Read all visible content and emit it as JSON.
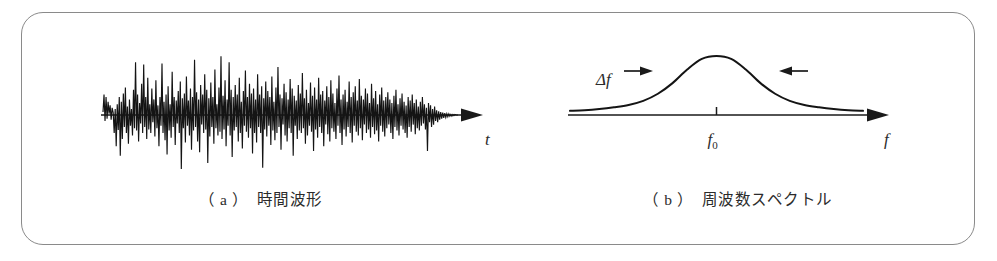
{
  "figure": {
    "background_color": "#ffffff",
    "border_color": "#8a8a8a",
    "ink_color": "#1a1a1a",
    "panels": [
      {
        "id": "a",
        "caption": "（ a ）　時間波形",
        "axis_label": "t",
        "type": "time-waveform"
      },
      {
        "id": "b",
        "caption": "（ b ）　周波数スペクトル",
        "axis_label": "f",
        "center_tick_label": "f",
        "center_tick_sub": "0",
        "bandwidth_label": "Δf",
        "type": "frequency-spectrum"
      }
    ]
  },
  "chart_data": [
    {
      "type": "line",
      "id": "time-waveform",
      "title": "（ a ）　時間波形",
      "xlabel": "t",
      "ylabel": "",
      "grid": false,
      "legend": null,
      "xlim": [
        0,
        360
      ],
      "ylim": [
        -1.15,
        1.15
      ],
      "baseline": 0,
      "description": "Random narrow-band noise amplitude versus time; zero baseline drawn as horizontal axis with arrowhead at right.",
      "values": [
        0.05,
        0.34,
        -0.1,
        0.3,
        -0.06,
        0.22,
        0.02,
        0.16,
        -0.08,
        0.12,
        0.04,
        -0.3,
        0.1,
        -0.52,
        0.18,
        -0.25,
        0.3,
        -0.68,
        0.22,
        -0.4,
        0.36,
        -0.2,
        0.46,
        -0.3,
        0.14,
        -0.48,
        0.26,
        -0.18,
        0.1,
        -0.34,
        0.42,
        -0.22,
        0.88,
        -0.26,
        0.34,
        -0.44,
        0.2,
        -0.14,
        0.52,
        -0.3,
        0.84,
        -0.2,
        0.3,
        -0.4,
        0.62,
        -0.24,
        0.18,
        -0.3,
        0.44,
        -0.12,
        0.26,
        -0.36,
        0.58,
        -0.22,
        0.16,
        -0.52,
        0.3,
        -0.18,
        0.86,
        -0.3,
        0.22,
        -0.42,
        0.34,
        -0.66,
        0.48,
        -0.26,
        0.18,
        -0.38,
        0.72,
        -0.2,
        0.3,
        -0.5,
        0.24,
        -0.14,
        0.4,
        -0.3,
        0.56,
        -0.9,
        0.28,
        -0.22,
        0.36,
        -0.46,
        0.64,
        -0.18,
        0.24,
        -0.34,
        0.44,
        -0.58,
        0.3,
        -0.26,
        0.92,
        -0.2,
        0.38,
        -0.44,
        0.26,
        -0.62,
        0.5,
        -0.16,
        0.34,
        -0.3,
        0.68,
        -0.24,
        0.42,
        -0.8,
        0.28,
        -0.36,
        0.54,
        -0.2,
        0.3,
        -0.48,
        0.76,
        -0.22,
        0.18,
        -0.34,
        0.46,
        -0.28,
        0.98,
        -0.4,
        0.32,
        -0.24,
        0.58,
        -0.52,
        0.26,
        -0.18,
        0.88,
        -0.34,
        0.42,
        -0.7,
        0.3,
        -0.26,
        0.5,
        -0.2,
        0.34,
        -0.44,
        0.62,
        -0.3,
        0.22,
        -0.56,
        0.4,
        -0.18,
        0.74,
        -0.28,
        0.3,
        -0.38,
        0.52,
        -0.22,
        0.36,
        -0.64,
        0.44,
        -0.3,
        0.26,
        -0.46,
        0.68,
        -0.2,
        0.34,
        -0.3,
        0.48,
        -0.88,
        0.28,
        -0.24,
        0.56,
        -0.36,
        0.4,
        -0.18,
        0.3,
        -0.5,
        0.64,
        -0.26,
        0.22,
        -0.42,
        0.46,
        -0.3,
        0.8,
        -0.2,
        0.34,
        -0.58,
        0.28,
        -0.16,
        0.52,
        -0.34,
        0.38,
        -0.44,
        0.26,
        -0.22,
        0.6,
        -0.3,
        0.44,
        -0.68,
        0.32,
        -0.18,
        0.24,
        -0.4,
        0.5,
        -0.26,
        0.36,
        -0.3,
        0.7,
        -0.22,
        0.28,
        -0.48,
        0.42,
        -0.34,
        0.2,
        -0.18,
        0.54,
        -0.28,
        0.32,
        -0.6,
        0.46,
        -0.24,
        0.26,
        -0.38,
        0.62,
        -0.2,
        0.34,
        -0.3,
        0.4,
        -0.52,
        0.24,
        -0.16,
        0.48,
        -0.32,
        0.3,
        -0.44,
        0.58,
        -0.22,
        0.36,
        -0.28,
        0.2,
        -0.4,
        0.44,
        -0.18,
        0.66,
        -0.3,
        0.26,
        -0.5,
        0.34,
        -0.24,
        0.42,
        -0.36,
        0.22,
        -0.2,
        0.56,
        -0.3,
        0.3,
        -0.46,
        0.38,
        -0.18,
        0.48,
        -0.28,
        0.24,
        -0.34,
        0.6,
        -0.22,
        0.32,
        -0.42,
        0.26,
        -0.16,
        0.44,
        -0.3,
        0.36,
        -0.24,
        0.2,
        -0.38,
        0.52,
        -0.2,
        0.28,
        -0.32,
        0.4,
        -0.26,
        0.18,
        -0.44,
        0.34,
        -0.18,
        0.46,
        -0.28,
        0.24,
        -0.36,
        0.3,
        -0.22,
        0.38,
        -0.16,
        0.26,
        -0.3,
        0.2,
        -0.4,
        0.32,
        -0.2,
        0.42,
        -0.26,
        0.18,
        -0.34,
        0.28,
        -0.18,
        0.36,
        -0.24,
        0.22,
        -0.3,
        0.16,
        -0.38,
        0.3,
        -0.2,
        0.24,
        -0.28,
        0.34,
        -0.16,
        0.2,
        -0.32,
        0.26,
        -0.22,
        0.14,
        -0.26,
        0.22,
        -0.18,
        0.3,
        -0.14,
        0.18,
        -0.24,
        0.12,
        -0.6,
        0.2,
        -0.12,
        0.16,
        -0.2,
        0.1,
        -0.16,
        0.14,
        -0.1,
        0.08,
        -0.12,
        0.06,
        -0.08,
        0.05,
        -0.06,
        0.04,
        -0.05,
        0.03,
        -0.04,
        0.02,
        -0.03,
        0.02,
        -0.02,
        0.01,
        -0.02,
        0.01,
        -0.01,
        0.01,
        0.0,
        0.0,
        0.0
      ]
    },
    {
      "type": "line",
      "id": "frequency-spectrum",
      "title": "（ b ）　周波数スペクトル",
      "xlabel": "f",
      "ylabel": "",
      "grid": false,
      "legend": null,
      "xlim": [
        0,
        320
      ],
      "ylim": [
        0,
        1.05
      ],
      "peak_x": 160,
      "peak_y": 1.0,
      "center_tick_label": "f0",
      "bandwidth_label": "Δf",
      "bandwidth_left_x": 108,
      "bandwidth_right_x": 212,
      "shape": "lorentzian",
      "half_width": 46,
      "description": "Bell-shaped (Lorentzian) power spectral density centered at f0, with Δf linewidth indicated by two inward-pointing arrows at the half-power points.",
      "x": [
        0,
        16,
        32,
        48,
        64,
        80,
        96,
        112,
        128,
        144,
        160,
        176,
        192,
        208,
        224,
        240,
        256,
        272,
        288,
        304,
        320
      ],
      "y": [
        0.07,
        0.08,
        0.1,
        0.13,
        0.17,
        0.24,
        0.36,
        0.54,
        0.77,
        0.95,
        1.0,
        0.95,
        0.77,
        0.54,
        0.36,
        0.24,
        0.17,
        0.13,
        0.1,
        0.08,
        0.07
      ]
    }
  ]
}
